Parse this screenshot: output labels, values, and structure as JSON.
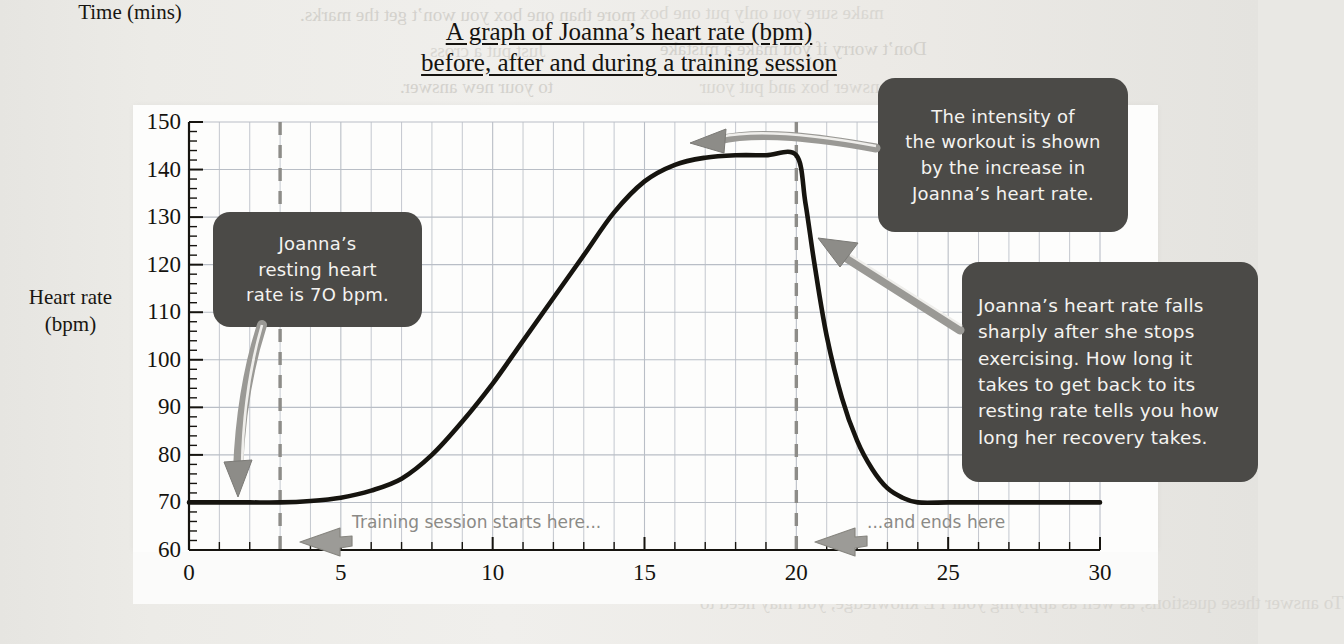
{
  "title": {
    "line1": "A graph of Joanna’s heart rate (bpm)",
    "line2": "before, after and during a training session"
  },
  "axes": {
    "y_label_line1": "Heart rate",
    "y_label_line2": "(bpm)",
    "x_label": "Time (mins)"
  },
  "callouts": [
    {
      "id": "resting-rate",
      "lines": [
        "Joanna’s",
        "resting heart",
        "rate is 7O bpm."
      ]
    },
    {
      "id": "intensity",
      "lines": [
        "The intensity of",
        "the workout is shown",
        "by the increase in",
        "Joanna’s heart rate."
      ]
    },
    {
      "id": "recovery",
      "lines": [
        "Joanna’s heart rate falls",
        "sharply after she stops",
        "exercising.  How long it",
        "takes to get back to its",
        "resting rate tells you how",
        "long her recovery takes."
      ]
    }
  ],
  "annotations": [
    {
      "id": "session-start",
      "text": "Training session starts here..."
    },
    {
      "id": "session-end",
      "text": "...and ends here"
    }
  ],
  "bleed_through": [
    {
      "text": "more than one box you won’t get the marks.",
      "x": 300,
      "y": 4,
      "size": 19
    },
    {
      "text": "Just put a cross",
      "x": 430,
      "y": 40,
      "size": 19
    },
    {
      "text": "to your new answer.",
      "x": 400,
      "y": 76,
      "size": 19
    },
    {
      "text": "make sure you only put one box",
      "x": 640,
      "y": 2,
      "size": 19
    },
    {
      "text": "Don’t worry if you make a mistake",
      "x": 660,
      "y": 38,
      "size": 19
    },
    {
      "text": "answer box and put your",
      "x": 700,
      "y": 76,
      "size": 19
    },
    {
      "text": "Sample answer",
      "x": 690,
      "y": 232,
      "size": 21
    },
    {
      "text": "Exercise",
      "x": 690,
      "y": 490,
      "size": 21
    },
    {
      "text": "Exercise 2",
      "x": 720,
      "y": 520,
      "size": 19
    },
    {
      "text": "To answer these questions, as well as applying your PE knowledge, you may need to",
      "x": 700,
      "y": 592,
      "size": 19
    }
  ],
  "colors": {
    "callout_bg": "#4b4a47",
    "callout_text": "#f4f3f0",
    "curve": "#16140f",
    "grid": "#b9bec6",
    "dashed_marker": "#8d8c88",
    "arrow": "#8a8986",
    "paper": "#eceae6",
    "panel": "#fdfdfc",
    "note_text": "#8b8a86"
  },
  "chart_data": {
    "type": "line",
    "title": "A graph of Joanna’s heart rate (bpm) before, after and during a training session",
    "xlabel": "Time (mins)",
    "ylabel": "Heart rate (bpm)",
    "xlim": [
      0,
      30
    ],
    "ylim": [
      60,
      150
    ],
    "xticks": [
      0,
      5,
      10,
      15,
      20,
      25,
      30
    ],
    "yticks": [
      60,
      70,
      80,
      90,
      100,
      110,
      120,
      130,
      140,
      150
    ],
    "grid": true,
    "legend": "none",
    "x_minor_tick_step": 1,
    "y_minor_tick_step": 2,
    "series": [
      {
        "name": "Heart rate",
        "x": [
          0,
          1,
          2,
          3,
          4,
          5,
          6,
          7,
          8,
          9,
          10,
          11,
          12,
          13,
          14,
          15,
          16,
          17,
          18,
          19,
          20,
          20.3,
          20.6,
          21,
          21.5,
          22,
          22.5,
          23,
          23.5,
          24,
          25,
          26,
          27,
          28,
          29,
          30
        ],
        "y": [
          70,
          70,
          70,
          70,
          70.3,
          71,
          72.5,
          75,
          80,
          87,
          95,
          104,
          113,
          122,
          131,
          137.5,
          141,
          142.5,
          143,
          143,
          143,
          133,
          120,
          105,
          92,
          83,
          77,
          73,
          71,
          70,
          70,
          70,
          70,
          70,
          70,
          70
        ]
      }
    ],
    "markers": [
      {
        "id": "session-start",
        "x": 3,
        "type": "vertical-dashed",
        "label": "Training session starts here..."
      },
      {
        "id": "session-end",
        "x": 20,
        "type": "vertical-dashed",
        "label": "...and ends here"
      }
    ],
    "resting_heart_rate": 70,
    "peak_heart_rate": 143
  }
}
